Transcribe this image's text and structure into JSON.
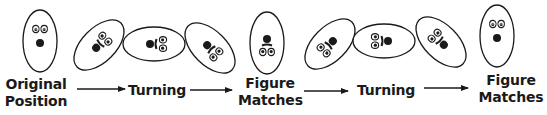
{
  "diagram": {
    "title": "",
    "colors": {
      "stroke": "#1a1a1a",
      "fill": "#ffffff",
      "text": "#1a1a1a"
    },
    "figures": [
      {
        "id": "fig-1",
        "cx": 40,
        "cy": 41,
        "rx": 18,
        "ry": 32,
        "angle": 0
      },
      {
        "id": "fig-2",
        "cx": 99,
        "cy": 45,
        "rx": 18,
        "ry": 32,
        "angle": 45
      },
      {
        "id": "fig-3",
        "cx": 154,
        "cy": 44,
        "rx": 18,
        "ry": 32,
        "angle": 90
      },
      {
        "id": "fig-4",
        "cx": 210,
        "cy": 48,
        "rx": 18,
        "ry": 32,
        "angle": 135
      },
      {
        "id": "fig-5",
        "cx": 267,
        "cy": 43,
        "rx": 18,
        "ry": 32,
        "angle": 180
      },
      {
        "id": "fig-6",
        "cx": 330,
        "cy": 44,
        "rx": 18,
        "ry": 32,
        "angle": 225
      },
      {
        "id": "fig-7",
        "cx": 384,
        "cy": 41,
        "rx": 18,
        "ry": 32,
        "angle": 270
      },
      {
        "id": "fig-8",
        "cx": 441,
        "cy": 42,
        "rx": 18,
        "ry": 32,
        "angle": 315
      },
      {
        "id": "fig-9",
        "cx": 497,
        "cy": 36,
        "rx": 18,
        "ry": 32,
        "angle": 360
      }
    ],
    "labels": [
      {
        "lines": [
          "Original",
          "Position"
        ],
        "x": 36,
        "y": 76
      },
      {
        "lines": [
          "Turning"
        ],
        "x": 155,
        "y": 82
      },
      {
        "lines": [
          "Figure",
          "Matches"
        ],
        "x": 269,
        "y": 76
      },
      {
        "lines": [
          "Turning"
        ],
        "x": 385,
        "y": 82
      },
      {
        "lines": [
          "Figure",
          "Matches"
        ],
        "x": 510,
        "y": 72
      }
    ],
    "label_text": {
      "original_line1": "Original",
      "original_line2": "Position",
      "turning_1": "Turning",
      "matches_1_line1": "Figure",
      "matches_1_line2": "Matches",
      "turning_2": "Turning",
      "matches_2_line1": "Figure",
      "matches_2_line2": "Matches"
    },
    "arrows": [
      {
        "x1": 77,
        "x2": 125,
        "y": 89
      },
      {
        "x1": 190,
        "x2": 232,
        "y": 90
      },
      {
        "x1": 304,
        "x2": 348,
        "y": 91
      },
      {
        "x1": 424,
        "x2": 468,
        "y": 88
      }
    ]
  }
}
